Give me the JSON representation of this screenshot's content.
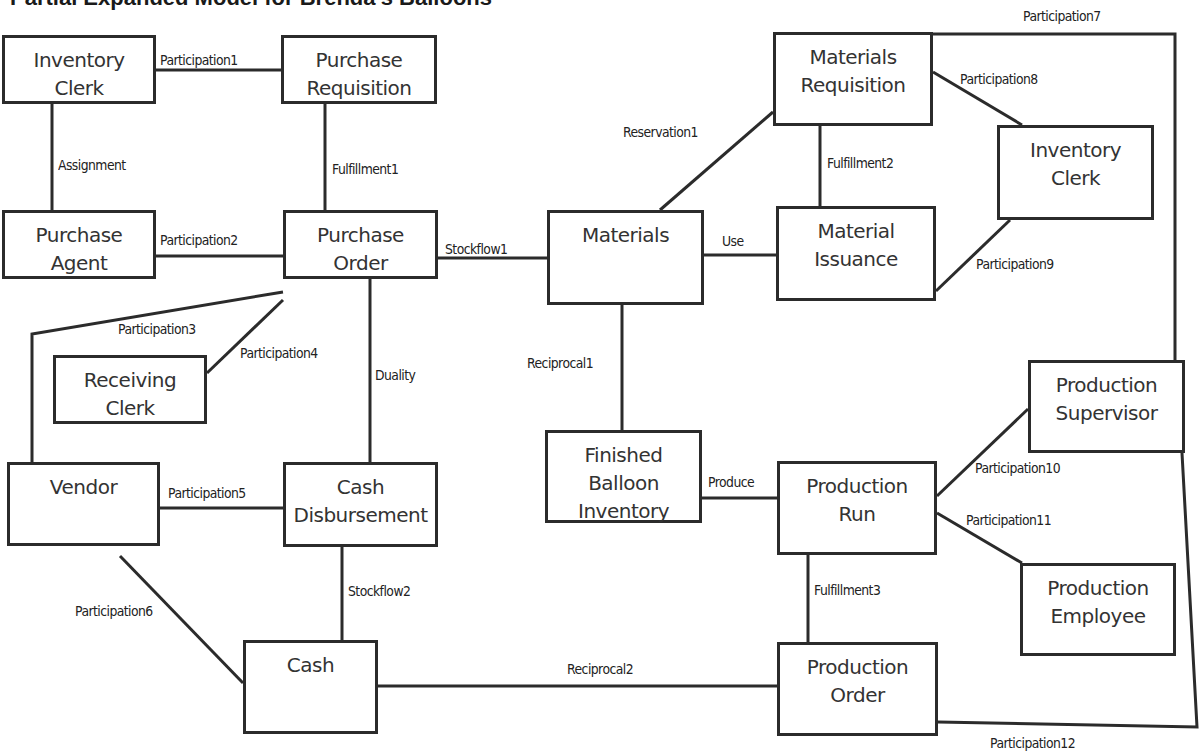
{
  "diagram": {
    "title": "Partial Expanded Model for Brenda's Balloons",
    "entities": [
      {
        "id": "inventory_clerk_1",
        "lines": [
          "Inventory",
          "Clerk"
        ],
        "x": 2,
        "y": 35,
        "w": 154,
        "h": 69
      },
      {
        "id": "purchase_requisition",
        "lines": [
          "Purchase",
          "Requisition"
        ],
        "x": 281,
        "y": 35,
        "w": 156,
        "h": 69
      },
      {
        "id": "purchase_agent",
        "lines": [
          "Purchase",
          "Agent"
        ],
        "x": 2,
        "y": 210,
        "w": 154,
        "h": 69
      },
      {
        "id": "purchase_order",
        "lines": [
          "Purchase",
          "Order"
        ],
        "x": 283,
        "y": 210,
        "w": 155,
        "h": 69
      },
      {
        "id": "receiving_clerk",
        "lines": [
          "Receiving",
          "Clerk"
        ],
        "x": 53,
        "y": 355,
        "w": 154,
        "h": 69
      },
      {
        "id": "vendor",
        "lines": [
          "Vendor"
        ],
        "x": 7,
        "y": 462,
        "w": 153,
        "h": 84
      },
      {
        "id": "cash_disbursement",
        "lines": [
          "Cash",
          "Disbursement"
        ],
        "x": 283,
        "y": 462,
        "w": 155,
        "h": 85
      },
      {
        "id": "cash",
        "lines": [
          "Cash"
        ],
        "x": 243,
        "y": 640,
        "w": 135,
        "h": 94
      },
      {
        "id": "materials",
        "lines": [
          "Materials"
        ],
        "x": 547,
        "y": 210,
        "w": 157,
        "h": 95
      },
      {
        "id": "materials_requisition",
        "lines": [
          "Materials",
          "Requisition"
        ],
        "x": 773,
        "y": 32,
        "w": 160,
        "h": 94
      },
      {
        "id": "inventory_clerk_2",
        "lines": [
          "Inventory",
          "Clerk"
        ],
        "x": 997,
        "y": 125,
        "w": 157,
        "h": 95
      },
      {
        "id": "material_issuance",
        "lines": [
          "Material",
          "Issuance"
        ],
        "x": 776,
        "y": 206,
        "w": 160,
        "h": 95
      },
      {
        "id": "finished_balloon_inventory",
        "lines": [
          "Finished",
          "Balloon",
          "Inventory"
        ],
        "x": 545,
        "y": 430,
        "w": 157,
        "h": 93
      },
      {
        "id": "production_run",
        "lines": [
          "Production",
          "Run"
        ],
        "x": 777,
        "y": 461,
        "w": 160,
        "h": 94
      },
      {
        "id": "production_supervisor",
        "lines": [
          "Production",
          "Supervisor"
        ],
        "x": 1028,
        "y": 360,
        "w": 157,
        "h": 93
      },
      {
        "id": "production_employee",
        "lines": [
          "Production",
          "Employee"
        ],
        "x": 1020,
        "y": 563,
        "w": 156,
        "h": 93
      },
      {
        "id": "production_order",
        "lines": [
          "Production",
          "Order"
        ],
        "x": 777,
        "y": 642,
        "w": 161,
        "h": 94
      }
    ],
    "relationships": [
      {
        "id": "participation1",
        "label": "Participation1",
        "points": [
          [
            156,
            70
          ],
          [
            281,
            70
          ]
        ],
        "lx": 160,
        "ly": 52
      },
      {
        "id": "assignment",
        "label": "Assignment",
        "points": [
          [
            52,
            104
          ],
          [
            52,
            210
          ]
        ],
        "lx": 58,
        "ly": 157
      },
      {
        "id": "fulfillment1",
        "label": "Fulfillment1",
        "points": [
          [
            325,
            104
          ],
          [
            325,
            210
          ]
        ],
        "lx": 332,
        "ly": 161
      },
      {
        "id": "participation2",
        "label": "Participation2",
        "points": [
          [
            156,
            256
          ],
          [
            283,
            256
          ]
        ],
        "lx": 160,
        "ly": 232
      },
      {
        "id": "stockflow1",
        "label": "Stockflow1",
        "points": [
          [
            438,
            258
          ],
          [
            547,
            258
          ]
        ],
        "lx": 445,
        "ly": 241
      },
      {
        "id": "participation3",
        "label": "Participation3",
        "points": [
          [
            283,
            292
          ],
          [
            32,
            334
          ],
          [
            32,
            462
          ]
        ],
        "lx": 118,
        "ly": 321
      },
      {
        "id": "participation4",
        "label": "Participation4",
        "points": [
          [
            283,
            300
          ],
          [
            207,
            373
          ]
        ],
        "lx": 240,
        "ly": 345
      },
      {
        "id": "duality",
        "label": "Duality",
        "points": [
          [
            370,
            279
          ],
          [
            370,
            462
          ]
        ],
        "lx": 375,
        "ly": 367
      },
      {
        "id": "participation5",
        "label": "Participation5",
        "points": [
          [
            160,
            508
          ],
          [
            283,
            508
          ]
        ],
        "lx": 168,
        "ly": 485
      },
      {
        "id": "stockflow2",
        "label": "Stockflow2",
        "points": [
          [
            342,
            547
          ],
          [
            342,
            640
          ]
        ],
        "lx": 348,
        "ly": 583
      },
      {
        "id": "participation6",
        "label": "Participation6",
        "points": [
          [
            120,
            556
          ],
          [
            243,
            683
          ]
        ],
        "lx": 75,
        "ly": 603
      },
      {
        "id": "reciprocal2",
        "label": "Reciprocal2",
        "points": [
          [
            378,
            686
          ],
          [
            777,
            686
          ]
        ],
        "lx": 567,
        "ly": 661
      },
      {
        "id": "reservation1",
        "label": "Reservation1",
        "points": [
          [
            660,
            210
          ],
          [
            773,
            112
          ]
        ],
        "lx": 623,
        "ly": 124
      },
      {
        "id": "use",
        "label": "Use",
        "points": [
          [
            704,
            255
          ],
          [
            776,
            255
          ]
        ],
        "lx": 722,
        "ly": 233
      },
      {
        "id": "fulfillment2",
        "label": "Fulfillment2",
        "points": [
          [
            820,
            126
          ],
          [
            820,
            206
          ]
        ],
        "lx": 827,
        "ly": 155
      },
      {
        "id": "participation7",
        "label": "Participation7",
        "points": [
          [
            933,
            34
          ],
          [
            1175,
            34
          ],
          [
            1175,
            360
          ]
        ],
        "lx": 1023,
        "ly": 8
      },
      {
        "id": "participation8",
        "label": "Participation8",
        "points": [
          [
            933,
            72
          ],
          [
            1022,
            125
          ]
        ],
        "lx": 960,
        "ly": 71
      },
      {
        "id": "participation9",
        "label": "Participation9",
        "points": [
          [
            936,
            291
          ],
          [
            1010,
            220
          ]
        ],
        "lx": 976,
        "ly": 256
      },
      {
        "id": "reciprocal1",
        "label": "Reciprocal1",
        "points": [
          [
            622,
            305
          ],
          [
            622,
            430
          ]
        ],
        "lx": 527,
        "ly": 355
      },
      {
        "id": "produce",
        "label": "Produce",
        "points": [
          [
            702,
            498
          ],
          [
            777,
            498
          ]
        ],
        "lx": 708,
        "ly": 474
      },
      {
        "id": "participation10",
        "label": "Participation10",
        "points": [
          [
            937,
            496
          ],
          [
            1028,
            409
          ]
        ],
        "lx": 975,
        "ly": 460
      },
      {
        "id": "participation11",
        "label": "Participation11",
        "points": [
          [
            937,
            513
          ],
          [
            1022,
            563
          ]
        ],
        "lx": 966,
        "ly": 512
      },
      {
        "id": "fulfillment3",
        "label": "Fulfillment3",
        "points": [
          [
            808,
            555
          ],
          [
            808,
            642
          ]
        ],
        "lx": 814,
        "ly": 582
      },
      {
        "id": "participation12",
        "label": "Participation12",
        "points": [
          [
            938,
            722
          ],
          [
            1197,
            727
          ],
          [
            1182,
            453
          ]
        ],
        "lx": 990,
        "ly": 735
      }
    ]
  },
  "colors": {
    "line": "#2b2b2b",
    "box_border": "#2b2b2b",
    "text": "#333333",
    "background": "#ffffff"
  }
}
